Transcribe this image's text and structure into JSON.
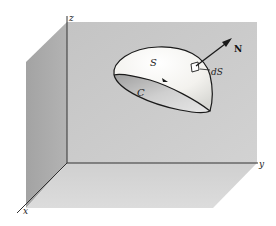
{
  "figure": {
    "axes": {
      "x_label": "x",
      "y_label": "y",
      "z_label": "z"
    },
    "surface_label": "S",
    "curve_label": "C",
    "normal_label": "N",
    "element_label": "dS"
  },
  "colors": {
    "background": "#ffffff",
    "back_wall": "#c9c9c9",
    "left_wall": "#a9a9a9",
    "floor": "#d6d6d6",
    "surface_light": "#fbfbf8",
    "surface_shadow": "#bdbdbd",
    "line": "#1a1a1a"
  }
}
